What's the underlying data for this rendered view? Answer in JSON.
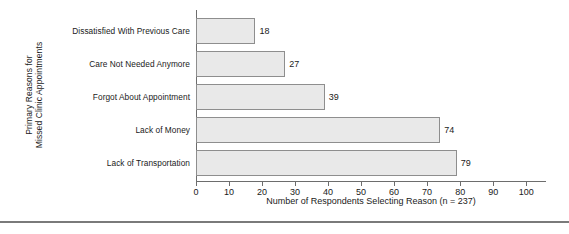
{
  "chart_data": {
    "type": "bar",
    "orientation": "horizontal",
    "title": "",
    "xlabel": "Number of Respondents Selecting Reason (n = 237)",
    "ylabel_line1": "Primary Reasons for",
    "ylabel_line2": "Missed Clinic Appointments",
    "categories": [
      "Dissatisfied With Previous Care",
      "Care Not Needed Anymore",
      "Forgot About Appointment",
      "Lack of Money",
      "Lack of Transportation"
    ],
    "values": [
      18,
      27,
      39,
      74,
      79
    ],
    "value_labels": [
      "18",
      "27",
      "39",
      "74",
      "79"
    ],
    "xlim": [
      0,
      106
    ],
    "xticks": [
      0,
      10,
      20,
      30,
      40,
      50,
      60,
      70,
      80,
      90,
      100
    ],
    "xtick_labels": [
      "0",
      "10",
      "20",
      "30",
      "40",
      "50",
      "60",
      "70",
      "80",
      "90",
      "100"
    ],
    "grid": false,
    "legend": false,
    "colors": {
      "bar_fill": "#e9e9e9",
      "bar_border": "#8e8e8e",
      "axis": "#6d6d6d",
      "text": "#1a1a1a",
      "rule": "#7a7a7a",
      "background": "#ffffff"
    }
  }
}
